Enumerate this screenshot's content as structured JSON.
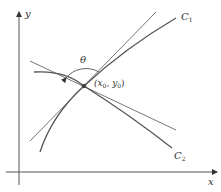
{
  "diagram": {
    "axes": {
      "x_label": "x",
      "y_label": "y"
    },
    "curves": [
      {
        "name": "C1",
        "label": "C",
        "subscript": "1"
      },
      {
        "name": "C2",
        "label": "C",
        "subscript": "2"
      }
    ],
    "angle_label": "θ",
    "point_label": {
      "text_x": "(x",
      "sub_x": "0",
      "sep": ", y",
      "sub_y": "0",
      "close": ")"
    },
    "colors": {
      "line": "#555555",
      "text": "#333333",
      "background": "#ffffff"
    }
  }
}
